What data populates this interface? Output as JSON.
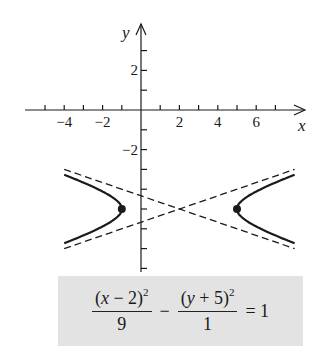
{
  "chart_data": {
    "type": "line",
    "title": "",
    "subtitle": "",
    "xlabel": "x",
    "ylabel": "y",
    "xlim": [
      -5.3,
      8.5
    ],
    "ylim": [
      -8.2,
      4.3
    ],
    "grid": false,
    "legend": null,
    "x_ticks": [
      -5,
      -4,
      -3,
      -2,
      -1,
      1,
      2,
      3,
      4,
      5,
      6,
      7
    ],
    "x_tick_labels": [
      "-4",
      "-2",
      "2",
      "4",
      "6"
    ],
    "x_tick_label_values": [
      -4,
      -2,
      2,
      4,
      6
    ],
    "y_ticks": [
      3,
      2,
      1,
      -1,
      -2,
      -3,
      -4,
      -5,
      -6,
      -7,
      -8
    ],
    "y_tick_labels": [
      "2",
      "-2"
    ],
    "y_tick_label_values": [
      2,
      -2
    ],
    "equation": "(x - 2)^2/9 - (y + 5)^2/1 = 1",
    "hyperbola": {
      "center": [
        2,
        -5
      ],
      "a": 3,
      "b": 1,
      "orientation": "horizontal",
      "vertices": [
        [
          -1,
          -5
        ],
        [
          5,
          -5
        ]
      ],
      "x_range": [
        -4,
        8
      ]
    },
    "series": [
      {
        "name": "hyperbola-left-branch",
        "style": "solid",
        "x": [
          -4,
          -3,
          -2,
          -1.5,
          -1,
          -1.5,
          -2,
          -3,
          -4
        ],
        "y": [
          -3.27,
          -3.67,
          -4.12,
          -4.44,
          -5,
          -5.56,
          -5.88,
          -6.33,
          -6.73
        ]
      },
      {
        "name": "hyperbola-right-branch",
        "style": "solid",
        "x": [
          8,
          7,
          6,
          5.5,
          5,
          5.5,
          6,
          7,
          8
        ],
        "y": [
          -3.27,
          -3.67,
          -4.12,
          -4.44,
          -5,
          -5.56,
          -5.88,
          -6.33,
          -6.73
        ]
      },
      {
        "name": "asymptote-1",
        "style": "dashed",
        "equation": "y + 5 = (1/3)(x - 2)",
        "x": [
          -4,
          8
        ],
        "y": [
          -7,
          -3
        ]
      },
      {
        "name": "asymptote-2",
        "style": "dashed",
        "equation": "y + 5 = -(1/3)(x - 2)",
        "x": [
          -4,
          8
        ],
        "y": [
          -3,
          -7
        ]
      }
    ],
    "points": [
      {
        "name": "left-vertex",
        "x": -1,
        "y": -5
      },
      {
        "name": "right-vertex",
        "x": 5,
        "y": -5
      }
    ]
  },
  "axes": {
    "x_label": "x",
    "y_label": "y",
    "x_tick_labels": [
      {
        "value": -4,
        "text": "−4"
      },
      {
        "value": -2,
        "text": "−2"
      },
      {
        "value": 2,
        "text": "2"
      },
      {
        "value": 4,
        "text": "4"
      },
      {
        "value": 6,
        "text": "6"
      }
    ],
    "y_tick_labels": [
      {
        "value": 2,
        "text": "2"
      },
      {
        "value": -2,
        "text": "−2"
      }
    ]
  },
  "equation_box": {
    "num1_a": "(",
    "num1_var": "x",
    "num1_b": " − 2)",
    "num1_exp": "2",
    "den1": "9",
    "minus": "−",
    "num2_a": "(",
    "num2_var": "y",
    "num2_b": " + 5)",
    "num2_exp": "2",
    "den2": "1",
    "equals": "= 1"
  },
  "colors": {
    "ink": "#1a1a1a",
    "box_background": "#e3e3e3",
    "background": "#ffffff"
  }
}
